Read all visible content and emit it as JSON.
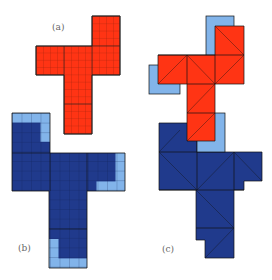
{
  "panels": [
    {
      "label": "(a)",
      "description": "red polyomino on fine grid"
    },
    {
      "label": "(b)",
      "description": "dark blue polyomino with light blue boundary cells"
    },
    {
      "label": "(c)",
      "description": "coarse triangulated red and blue shapes overlapping"
    }
  ],
  "colors": {
    "red": "#ff3414",
    "dark_blue": "#203a8c",
    "light_blue": "#82b4ea",
    "grid_line": "#1a1a1a"
  }
}
